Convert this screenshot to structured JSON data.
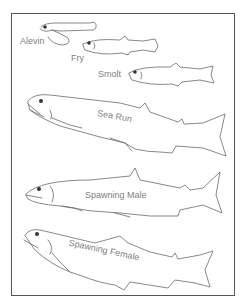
{
  "diagram": {
    "title": "",
    "stages": [
      {
        "id": "alevin",
        "label": "Alevin"
      },
      {
        "id": "fry",
        "label": "Fry"
      },
      {
        "id": "smolt",
        "label": "Smolt"
      },
      {
        "id": "sea-run",
        "label": "Sea Run"
      },
      {
        "id": "spawning-male",
        "label": "Spawning Male"
      },
      {
        "id": "spawning-female",
        "label": "Spawning Female"
      }
    ],
    "colors": {
      "line": "#6a6a6a",
      "label": "#808080",
      "frame": "#555555",
      "background": "#ffffff"
    }
  }
}
